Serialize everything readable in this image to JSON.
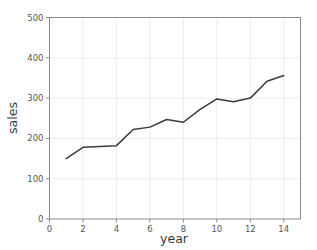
{
  "chart_data": {
    "type": "line",
    "title": "",
    "xlabel": "year",
    "ylabel": "sales",
    "x": [
      1,
      2,
      3,
      4,
      5,
      6,
      7,
      8,
      9,
      10,
      11,
      12,
      13,
      14
    ],
    "values": [
      150,
      178,
      180,
      182,
      222,
      228,
      247,
      240,
      272,
      298,
      291,
      300,
      342,
      356
    ],
    "series": [
      {
        "name": "sales",
        "values": [
          150,
          178,
          180,
          182,
          222,
          228,
          247,
          240,
          272,
          298,
          291,
          300,
          342,
          356
        ]
      }
    ],
    "xlim": [
      0,
      15
    ],
    "ylim": [
      0,
      500
    ],
    "xticks": [
      0,
      2,
      4,
      6,
      8,
      10,
      12,
      14
    ],
    "xtick_labels": [
      "0",
      "2",
      "4",
      "6",
      "8",
      "10",
      "12",
      "14"
    ],
    "yticks": [
      0,
      100,
      200,
      300,
      400,
      500
    ],
    "ytick_labels": [
      "0",
      "100",
      "200",
      "300",
      "400",
      "500"
    ],
    "grid": true,
    "legend": false,
    "line_color": "#3b3b3b",
    "grid_color": "#e9e9e9",
    "axis_color": "#8a8a8a",
    "background_color": "#ffffff"
  },
  "axes": {
    "x_axis_label": "year",
    "y_axis_label": "sales"
  }
}
